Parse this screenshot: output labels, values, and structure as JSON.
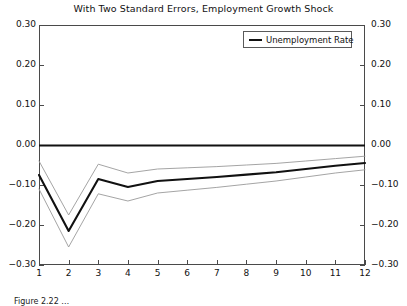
{
  "chart_data": {
    "type": "line",
    "title": "With Two Standard Errors, Employment Growth Shock",
    "xlabel": "",
    "ylabel": "",
    "xlim": [
      1,
      12
    ],
    "ylim": [
      -0.3,
      0.3
    ],
    "grid": false,
    "legend_position": "top-right",
    "x": [
      1,
      2,
      3,
      4,
      5,
      6,
      7,
      8,
      9,
      10,
      11,
      12
    ],
    "xticks": [
      "1",
      "2",
      "3",
      "4",
      "5",
      "6",
      "7",
      "8",
      "9",
      "10",
      "11",
      "12"
    ],
    "yticks": [
      "0.30",
      "0.20",
      "0.10",
      "0.00",
      "-0.10",
      "-0.20",
      "-0.30"
    ],
    "ytick_values": [
      0.3,
      0.2,
      0.1,
      0.0,
      -0.1,
      -0.2,
      -0.3
    ],
    "zero_line": 0.0,
    "series": [
      {
        "name": "Unemployment Rate",
        "role": "estimate",
        "color": "#111111",
        "width": 2.1,
        "values": [
          -0.075,
          -0.215,
          -0.085,
          -0.105,
          -0.09,
          -0.085,
          -0.08,
          -0.074,
          -0.068,
          -0.06,
          -0.052,
          -0.045
        ]
      },
      {
        "name": "Upper Two Standard Errors",
        "role": "upper-band",
        "color": "#9a9a9a",
        "width": 0.9,
        "values": [
          -0.04,
          -0.175,
          -0.048,
          -0.07,
          -0.06,
          -0.057,
          -0.054,
          -0.05,
          -0.046,
          -0.04,
          -0.034,
          -0.028
        ]
      },
      {
        "name": "Lower Two Standard Errors",
        "role": "lower-band",
        "color": "#9a9a9a",
        "width": 0.9,
        "values": [
          -0.11,
          -0.255,
          -0.122,
          -0.14,
          -0.12,
          -0.113,
          -0.106,
          -0.098,
          -0.09,
          -0.08,
          -0.07,
          -0.062
        ]
      }
    ],
    "legend": [
      {
        "label": "Unemployment Rate",
        "color": "#111111"
      }
    ]
  },
  "caption": {
    "text": "Figure 2.22 …"
  }
}
